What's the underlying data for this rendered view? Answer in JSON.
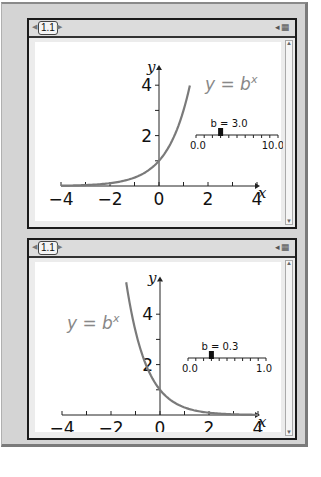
{
  "panels": [
    {
      "tab_label": "1.1",
      "tab_icons": "◂▦",
      "scroll_up": "▲",
      "scroll_down": "▼"
    },
    {
      "tab_label": "1.1",
      "tab_icons": "◂▦",
      "scroll_up": "▲",
      "scroll_down": "▼"
    }
  ],
  "chart_data": [
    {
      "type": "line",
      "title": "",
      "function": "y = b^x",
      "equation_label": "y = b",
      "equation_sup": "x",
      "b": 3.0,
      "xlabel": "x",
      "ylabel": "y",
      "xlim": [
        -4,
        4.3
      ],
      "ylim": [
        0,
        4.6
      ],
      "xticks": [
        -4,
        -3,
        -2,
        -1,
        0,
        1,
        2,
        3,
        4
      ],
      "xtick_labels": [
        {
          "x": -4,
          "label": "−4"
        },
        {
          "x": -2,
          "label": "−2"
        },
        {
          "x": 0,
          "label": "0"
        },
        {
          "x": 2,
          "label": "2"
        },
        {
          "x": 4,
          "label": "4"
        }
      ],
      "yticks": [
        1,
        2,
        3,
        4
      ],
      "ytick_labels": [
        {
          "y": 2,
          "label": "2"
        },
        {
          "y": 4,
          "label": "4"
        }
      ],
      "curve_x_range": [
        -4,
        1.26
      ],
      "curve_color": "#7a7a7a",
      "slider": {
        "label": "b = 3.0",
        "min": 0.0,
        "max": 10.0,
        "min_label": "0.0",
        "max_label": "10.0",
        "value": 3.0,
        "ticks": 10
      },
      "legend_position": "top-right"
    },
    {
      "type": "line",
      "title": "",
      "function": "y = b^x",
      "equation_label": "y = b",
      "equation_sup": "x",
      "b": 0.3,
      "xlabel": "x",
      "ylabel": "y",
      "xlim": [
        -4,
        4.3
      ],
      "ylim": [
        0,
        5.3
      ],
      "xticks": [
        -4,
        -3,
        -2,
        -1,
        0,
        1,
        2,
        3,
        4
      ],
      "xtick_labels": [
        {
          "x": -4,
          "label": "−4"
        },
        {
          "x": -2,
          "label": "−2"
        },
        {
          "x": 0,
          "label": "0"
        },
        {
          "x": 2,
          "label": "2"
        },
        {
          "x": 4,
          "label": "4"
        }
      ],
      "yticks": [
        1,
        2,
        3,
        4
      ],
      "ytick_labels": [
        {
          "y": 2,
          "label": "2"
        },
        {
          "y": 4,
          "label": "4"
        }
      ],
      "curve_x_range": [
        -1.38,
        4
      ],
      "curve_color": "#7a7a7a",
      "slider": {
        "label": "b = 0.3",
        "min": 0.0,
        "max": 1.0,
        "min_label": "0.0",
        "max_label": "1.0",
        "value": 0.3,
        "ticks": 10
      },
      "legend_position": "top-left"
    }
  ]
}
